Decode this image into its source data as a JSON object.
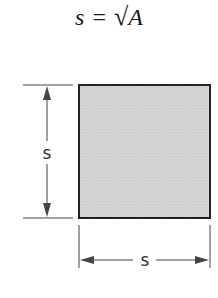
{
  "formula": {
    "lhs": "s",
    "equals": "=",
    "radical": "√",
    "rhs": "A"
  },
  "diagram": {
    "shape": "square",
    "fill_color": "#d4d4d4",
    "stroke_color": "#222222",
    "vertical_dimension_label": "s",
    "horizontal_dimension_label": "s"
  }
}
